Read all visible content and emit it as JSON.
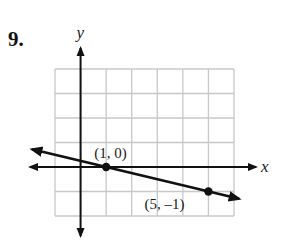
{
  "problem": {
    "number": "9."
  },
  "chart_data": {
    "type": "line",
    "title": "",
    "xlabel": "x",
    "ylabel": "y",
    "xlim": [
      -1,
      6
    ],
    "ylim": [
      -2,
      4
    ],
    "grid": true,
    "grid_step": 1,
    "tick_labels": false,
    "series": [
      {
        "name": "line",
        "x": [
          1,
          5
        ],
        "y": [
          0,
          -1
        ],
        "slope": -0.25,
        "extends_both_directions": true
      }
    ],
    "points": [
      {
        "x": 1,
        "y": 0,
        "label": "(1, 0)"
      },
      {
        "x": 5,
        "y": -1,
        "label": "(5, –1)"
      }
    ],
    "colors": {
      "grid": "#c8c8c8",
      "axes": "#111111",
      "line": "#111111"
    }
  }
}
